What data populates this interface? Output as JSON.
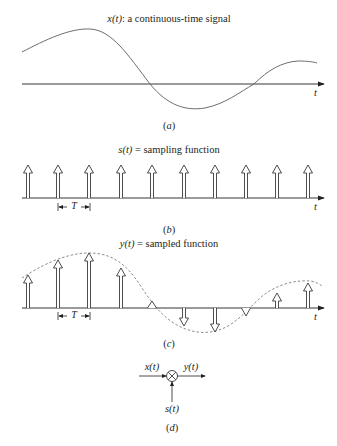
{
  "panels": {
    "a": {
      "title_var": "x(t)",
      "title_rest": ": a continuous-time signal",
      "axis_label": "t",
      "caption": "(a)"
    },
    "b": {
      "title_var": "s(t)",
      "title_rest": " = sampling function",
      "axis_label": "t",
      "period_label": "T",
      "caption": "(b)",
      "sample_count": 10
    },
    "c": {
      "title_var": "y(t)",
      "title_rest": " = sampled function",
      "axis_label": "t",
      "period_label": "T",
      "caption": "(c)"
    },
    "d": {
      "input_label": "x(t)",
      "output_label": "y(t)",
      "sampling_label": "s(t)",
      "operator_symbol": "×",
      "caption": "(d)"
    }
  },
  "colors": {
    "line": "#231f20",
    "curve": "#6d6e71",
    "background": "#ffffff"
  }
}
